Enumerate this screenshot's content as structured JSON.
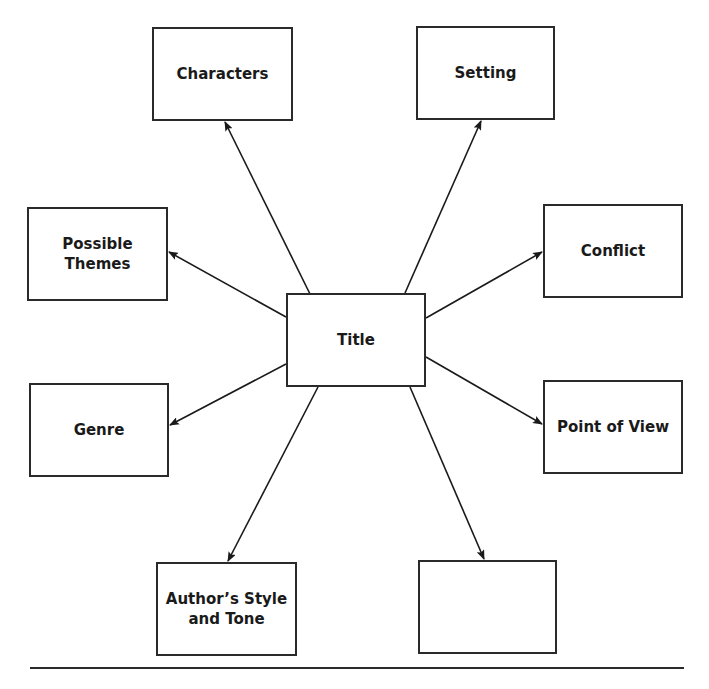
{
  "diagram": {
    "type": "story-map",
    "center": {
      "label": "Title"
    },
    "nodes": [
      {
        "id": "characters",
        "label": "Characters"
      },
      {
        "id": "setting",
        "label": "Setting"
      },
      {
        "id": "themes",
        "label": "Possible\nThemes"
      },
      {
        "id": "conflict",
        "label": "Conflict"
      },
      {
        "id": "genre",
        "label": "Genre"
      },
      {
        "id": "pov",
        "label": "Point of View"
      },
      {
        "id": "style",
        "label": "Author’s Style\nand Tone"
      },
      {
        "id": "blank",
        "label": ""
      }
    ],
    "edges": [
      {
        "from": "center",
        "to": "characters"
      },
      {
        "from": "center",
        "to": "setting"
      },
      {
        "from": "center",
        "to": "themes"
      },
      {
        "from": "center",
        "to": "conflict"
      },
      {
        "from": "center",
        "to": "genre"
      },
      {
        "from": "center",
        "to": "pov"
      },
      {
        "from": "center",
        "to": "style"
      },
      {
        "from": "center",
        "to": "blank"
      }
    ],
    "colors": {
      "stroke": "#2a2a2a",
      "background": "#ffffff"
    }
  }
}
